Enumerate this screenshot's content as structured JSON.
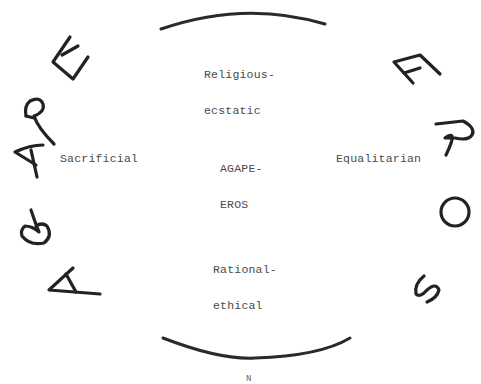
{
  "diagram": {
    "top_label": {
      "line1": "Religious-",
      "line2": "ecstatic"
    },
    "center_label": {
      "line1": "AGAPE-",
      "line2": "EROS"
    },
    "left_label": "Sacrificial",
    "right_label": "Equalitarian",
    "bottom_label": {
      "line1": "Rational-",
      "line2": "ethical"
    },
    "footer_mark": "N",
    "left_arc_word": "AGAPE",
    "right_arc_word": "EROS",
    "left_arc_letters": [
      "A",
      "G",
      "A",
      "P",
      "E"
    ],
    "right_arc_letters": [
      "E",
      "R",
      "O",
      "S"
    ],
    "colors": {
      "ink": "#222222",
      "text": "#4a4a4a",
      "background": "#ffffff"
    }
  }
}
